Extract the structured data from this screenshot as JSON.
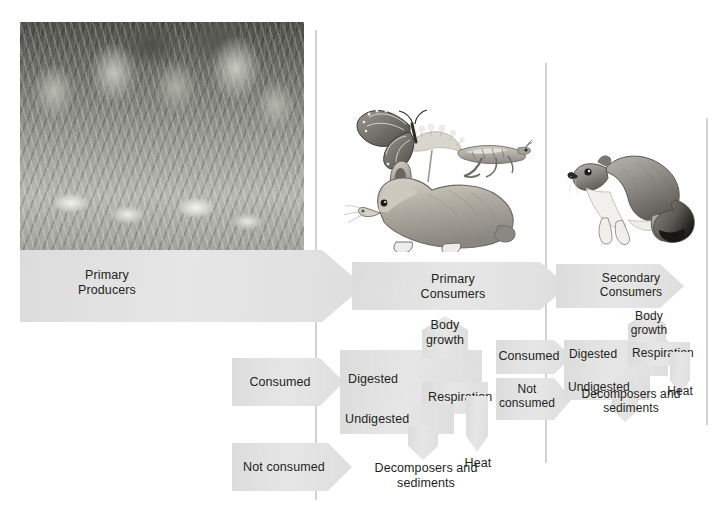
{
  "figure": {
    "accent_gray": "#e2e2e2",
    "divider_gray": "#d2d2d2",
    "text_color": "#231f20"
  },
  "dividers": [
    {
      "name": "divider-producers-consumers",
      "x": 315,
      "y": 30,
      "height": 470
    },
    {
      "name": "divider-primary-secondary",
      "x": 545,
      "y": 63,
      "height": 400
    },
    {
      "name": "divider-right-edge",
      "x": 706,
      "y": 118,
      "height": 307
    }
  ],
  "images": [
    {
      "name": "meadow-photo",
      "caption": "Wildflower meadow with coneflowers"
    },
    {
      "name": "rabbit-illustration",
      "caption": "Rabbit"
    },
    {
      "name": "butterfly-illustration",
      "caption": "Monarch butterfly on flower"
    },
    {
      "name": "grasshopper-illustration",
      "caption": "Grasshopper"
    },
    {
      "name": "weasel-illustration",
      "caption": "Weasel"
    }
  ],
  "trophic": {
    "producers": {
      "label_line1": "Primary",
      "label_line2": "Producers",
      "consumed": "Consumed",
      "not_consumed": "Not consumed"
    },
    "primary_consumers": {
      "label_line1": "Primary",
      "label_line2": "Consumers",
      "digested": "Digested",
      "undigested": "Undigested",
      "body_growth_line1": "Body",
      "body_growth_line2": "growth",
      "respiration": "Respiration",
      "heat": "Heat",
      "decomposers_line1": "Decomposers and",
      "decomposers_line2": "sediments",
      "consumed": "Consumed",
      "not_consumed_line1": "Not",
      "not_consumed_line2": "consumed"
    },
    "secondary_consumers": {
      "label_line1": "Secondary",
      "label_line2": "Consumers",
      "digested": "Digested",
      "undigested": "Undigested",
      "body_growth_line1": "Body",
      "body_growth_line2": "growth",
      "respiration": "Respiration",
      "heat": "Heat",
      "decomposers_line1": "Decomposers and",
      "decomposers_line2": "sediments"
    }
  }
}
